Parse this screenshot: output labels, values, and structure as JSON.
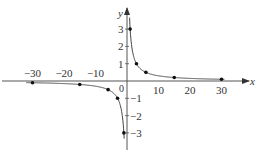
{
  "chart_data": {
    "type": "line",
    "title": "",
    "xlabel": "x",
    "ylabel": "y",
    "x_ticks": [
      -30,
      -20,
      -10,
      0,
      10,
      20,
      30
    ],
    "x_tick_labels": [
      "−30",
      "−20",
      "−10",
      "0",
      "10",
      "20",
      "30"
    ],
    "y_ticks": [
      3,
      2,
      1,
      -1,
      -2,
      -3
    ],
    "y_tick_labels": [
      "3",
      "2",
      "1",
      "−1",
      "−2",
      "−3"
    ],
    "xlim": [
      -33,
      38
    ],
    "ylim": [
      -3.8,
      3.8
    ],
    "grid": false,
    "legend": null,
    "series": [
      {
        "name": "right branch",
        "x": [
          1,
          3,
          6,
          15,
          30
        ],
        "y": [
          3,
          1,
          0.5,
          0.2,
          0.1
        ]
      },
      {
        "name": "left branch",
        "x": [
          -1,
          -3,
          -6,
          -15,
          -30
        ],
        "y": [
          -3,
          -1,
          -0.5,
          -0.2,
          -0.1
        ]
      }
    ],
    "curve_description": "Hyperbola-like curve y = 3/x with marked points; vertical asymptote x = 0, horizontal asymptote y = 0"
  },
  "labels": {
    "x_axis": "x",
    "y_axis": "y",
    "origin": "0"
  }
}
